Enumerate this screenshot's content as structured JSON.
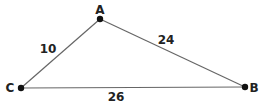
{
  "diagram": {
    "vertices": [
      {
        "id": "A",
        "label": "A",
        "x": 100,
        "y": 19
      },
      {
        "id": "B",
        "label": "B",
        "x": 245,
        "y": 87
      },
      {
        "id": "C",
        "label": "C",
        "x": 21,
        "y": 88
      }
    ],
    "edges": [
      {
        "from": "A",
        "to": "C",
        "length_label": "10"
      },
      {
        "from": "A",
        "to": "B",
        "length_label": "24"
      },
      {
        "from": "C",
        "to": "B",
        "length_label": "26"
      }
    ],
    "colors": {
      "line": "#666666",
      "point": "#111111",
      "text": "#222222"
    }
  }
}
